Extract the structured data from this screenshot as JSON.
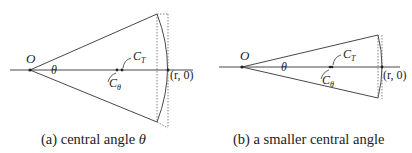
{
  "panels": [
    {
      "id": "a",
      "origin_label": "O",
      "angle_label": "θ",
      "ct_label": "C",
      "ct_sub": "T",
      "cth_label": "C",
      "cth_sub": "θ",
      "point_label": "(r, 0)",
      "caption_prefix": "(a) central angle ",
      "caption_var": "θ"
    },
    {
      "id": "b",
      "origin_label": "O",
      "angle_label": "θ",
      "ct_label": "C",
      "ct_sub": "T",
      "cth_label": "C",
      "cth_sub": "θ",
      "point_label": "(r, 0)",
      "caption": "(b) a smaller central angle"
    }
  ],
  "colors": {
    "line": "#333333",
    "dotted": "#666666",
    "text": "#222222"
  }
}
